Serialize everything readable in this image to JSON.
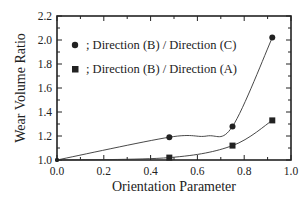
{
  "chart_data": {
    "type": "line",
    "title": "",
    "xlabel": "Orientation Parameter",
    "ylabel": "Wear Volume Ratio",
    "xlim": [
      0.0,
      1.0
    ],
    "ylim": [
      1.0,
      2.2
    ],
    "xticks": [
      "0.0",
      "0.2",
      "0.4",
      "0.6",
      "0.8",
      "1.0"
    ],
    "yticks": [
      "1.0",
      "1.2",
      "1.4",
      "1.6",
      "1.8",
      "2.0",
      "2.2"
    ],
    "grid": false,
    "legend_position": "upper-left (inside)",
    "series": [
      {
        "name": "; Direction (B) / Direction (C)",
        "marker": "circle",
        "x": [
          0.0,
          0.48,
          0.75,
          0.92
        ],
        "values": [
          1.0,
          1.19,
          1.28,
          2.02
        ]
      },
      {
        "name": "; Direction (B) / Direction (A)",
        "marker": "square",
        "x": [
          0.0,
          0.48,
          0.75,
          0.92
        ],
        "values": [
          1.0,
          1.02,
          1.12,
          1.33
        ]
      }
    ],
    "colors": {
      "ink": "#222222",
      "background": "#ffffff"
    }
  }
}
